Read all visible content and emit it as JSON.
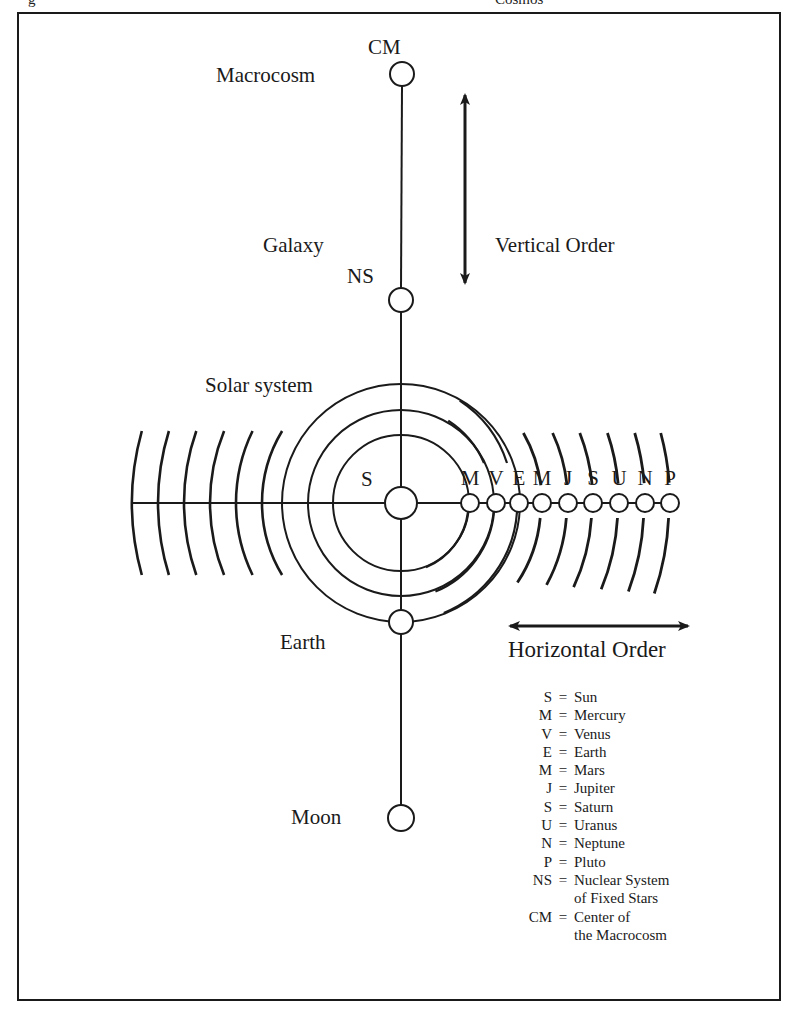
{
  "figure": {
    "caption_fragment_left": "g",
    "caption_fragment_right": "Cosmos"
  },
  "vertical_axis": {
    "nodes": [
      {
        "id": "CM",
        "abbr": "CM",
        "label": "Macrocosm",
        "cx": 402,
        "cy": 74,
        "r": 12
      },
      {
        "id": "NS",
        "abbr": "NS",
        "label": "Galaxy",
        "cx": 401,
        "cy": 300,
        "r": 12
      },
      {
        "id": "S",
        "abbr": "S",
        "label": "Solar system",
        "cx": 401,
        "cy": 503,
        "r": 16
      },
      {
        "id": "Earth",
        "abbr": "",
        "label": "Earth",
        "cx": 401,
        "cy": 622,
        "r": 12
      },
      {
        "id": "Moon",
        "abbr": "",
        "label": "Moon",
        "cx": 401,
        "cy": 818,
        "r": 13
      }
    ]
  },
  "labels": {
    "cm": "CM",
    "macrocosm": "Macrocosm",
    "galaxy": "Galaxy",
    "ns": "NS",
    "solar_system": "Solar system",
    "sun": "S",
    "earth": "Earth",
    "moon": "Moon",
    "vertical_order": "Vertical Order",
    "horizontal_order": "Horizontal Order"
  },
  "planets": [
    {
      "letter": "M",
      "name": "Mercury",
      "cx": 470
    },
    {
      "letter": "V",
      "name": "Venus",
      "cx": 496
    },
    {
      "letter": "E",
      "name": "Earth",
      "cx": 519
    },
    {
      "letter": "M",
      "name": "Mars",
      "cx": 542
    },
    {
      "letter": "J",
      "name": "Jupiter",
      "cx": 568
    },
    {
      "letter": "S",
      "name": "Saturn",
      "cx": 593
    },
    {
      "letter": "U",
      "name": "Uranus",
      "cx": 619
    },
    {
      "letter": "N",
      "name": "Neptune",
      "cx": 645
    },
    {
      "letter": "P",
      "name": "Pluto",
      "cx": 670
    }
  ],
  "orbits": {
    "sun_center": [
      401,
      503
    ],
    "full_circle_radii": [
      68,
      93,
      119
    ],
    "left_arc_x": [
      132,
      158,
      184,
      210,
      236,
      262
    ]
  },
  "legend": [
    {
      "abbr": "S",
      "def": "Sun"
    },
    {
      "abbr": "M",
      "def": "Mercury"
    },
    {
      "abbr": "V",
      "def": "Venus"
    },
    {
      "abbr": "E",
      "def": "Earth"
    },
    {
      "abbr": "M",
      "def": "Mars"
    },
    {
      "abbr": "J",
      "def": "Jupiter"
    },
    {
      "abbr": "S",
      "def": "Saturn"
    },
    {
      "abbr": "U",
      "def": "Uranus"
    },
    {
      "abbr": "N",
      "def": "Neptune"
    },
    {
      "abbr": "P",
      "def": "Pluto"
    },
    {
      "abbr": "NS",
      "def": "Nuclear System"
    },
    {
      "abbr": "",
      "def": "of Fixed Stars"
    },
    {
      "abbr": "CM",
      "def": "Center of"
    },
    {
      "abbr": "",
      "def": "the Macrocosm"
    }
  ],
  "legend_equals": "="
}
